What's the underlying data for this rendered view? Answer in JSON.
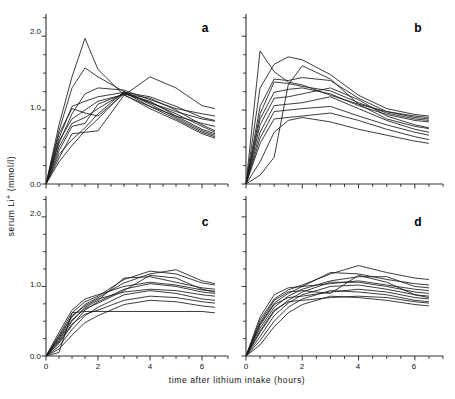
{
  "figure": {
    "xlabel": "time after lithium intake (hours)",
    "ylabel_parts": {
      "pre": "serum Li",
      "sup": "+",
      "post": " (mmol/l)"
    },
    "ylabel": "serum Li+ (mmol/l)",
    "panel_a_letter": "a",
    "panel_b_letter": "b",
    "panel_c_letter": "c",
    "panel_d_letter": "d",
    "ytick_0": "0.0",
    "ytick_1": "1.0",
    "ytick_2": "2.0",
    "xtick_0": "0",
    "xtick_2": "2",
    "xtick_4": "4",
    "xtick_6": "6",
    "line_color": "#1a1a1a",
    "axis_color": "#333333"
  },
  "chart_data": [
    {
      "type": "line",
      "panel": "a",
      "title": "a",
      "xlabel": "time after lithium intake (hours)",
      "ylabel": "serum Li+ (mmol/l)",
      "xlim": [
        0,
        7
      ],
      "ylim": [
        0.0,
        2.3
      ],
      "xticks": [
        0,
        1,
        2,
        3,
        4,
        5,
        6,
        7
      ],
      "xticklabels": [
        "0",
        "",
        "2",
        "",
        "4",
        "",
        "6",
        ""
      ],
      "yticks": [
        0.0,
        0.5,
        1.0,
        1.5,
        2.0
      ],
      "yticklabels": [
        "0.0",
        "",
        "1.0",
        "",
        "2.0"
      ],
      "grid": false,
      "legend": "none",
      "x": [
        0,
        0.5,
        1,
        1.5,
        2,
        3,
        4,
        5,
        6,
        6.5
      ],
      "series": [
        {
          "name": "subject 1",
          "values": [
            0.0,
            0.8,
            1.45,
            1.97,
            1.55,
            1.2,
            1.05,
            0.92,
            0.82,
            0.78
          ]
        },
        {
          "name": "subject 2",
          "values": [
            0.0,
            0.72,
            1.3,
            1.57,
            1.45,
            1.25,
            1.1,
            0.98,
            0.88,
            0.85
          ]
        },
        {
          "name": "subject 3",
          "values": [
            0.0,
            0.55,
            0.95,
            1.22,
            1.3,
            1.27,
            1.14,
            1.02,
            0.95,
            0.92
          ]
        },
        {
          "name": "subject 4",
          "values": [
            0.0,
            0.62,
            1.05,
            1.12,
            1.18,
            1.24,
            1.18,
            1.05,
            0.9,
            0.86
          ]
        },
        {
          "name": "subject 5",
          "values": [
            0.0,
            0.45,
            0.78,
            0.82,
            1.08,
            1.22,
            1.16,
            1.0,
            0.8,
            0.72
          ]
        },
        {
          "name": "subject 6",
          "values": [
            0.0,
            0.5,
            0.82,
            0.9,
            1.02,
            1.23,
            1.1,
            0.95,
            0.78,
            0.7
          ]
        },
        {
          "name": "subject 7",
          "values": [
            0.0,
            0.35,
            0.68,
            0.7,
            0.72,
            1.2,
            1.45,
            1.3,
            1.06,
            1.02
          ]
        },
        {
          "name": "subject 8",
          "values": [
            0.0,
            0.68,
            1.02,
            0.96,
            0.92,
            1.22,
            1.12,
            0.92,
            0.74,
            0.68
          ]
        },
        {
          "name": "subject 9",
          "values": [
            0.0,
            0.3,
            0.52,
            0.72,
            0.88,
            1.24,
            1.05,
            0.88,
            0.7,
            0.64
          ]
        },
        {
          "name": "subject 10",
          "values": [
            0.0,
            0.4,
            0.6,
            0.76,
            0.95,
            1.25,
            1.08,
            0.9,
            0.72,
            0.66
          ]
        },
        {
          "name": "subject 11",
          "values": [
            0.0,
            0.58,
            0.88,
            1.0,
            1.12,
            1.21,
            1.02,
            0.86,
            0.68,
            0.62
          ]
        }
      ]
    },
    {
      "type": "line",
      "panel": "b",
      "title": "b",
      "xlabel": "time after lithium intake (hours)",
      "ylabel": "serum Li+ (mmol/l)",
      "xlim": [
        0,
        7
      ],
      "ylim": [
        0.0,
        2.3
      ],
      "xticks": [
        0,
        1,
        2,
        3,
        4,
        5,
        6,
        7
      ],
      "xticklabels": [
        "0",
        "",
        "2",
        "",
        "4",
        "",
        "6",
        ""
      ],
      "yticks": [
        0.0,
        0.5,
        1.0,
        1.5,
        2.0
      ],
      "yticklabels": [
        "0.0",
        "",
        "1.0",
        "",
        "2.0"
      ],
      "grid": false,
      "legend": "none",
      "x": [
        0,
        0.5,
        1,
        1.5,
        2,
        3,
        4,
        5,
        6,
        6.5
      ],
      "series": [
        {
          "name": "subject 1",
          "values": [
            0.0,
            1.8,
            1.52,
            1.38,
            1.34,
            1.2,
            1.08,
            0.98,
            0.92,
            0.9
          ]
        },
        {
          "name": "subject 2",
          "values": [
            0.0,
            1.3,
            1.62,
            1.72,
            1.68,
            1.48,
            1.2,
            1.02,
            0.94,
            0.92
          ]
        },
        {
          "name": "subject 3",
          "values": [
            0.0,
            1.05,
            1.42,
            1.4,
            1.44,
            1.4,
            1.16,
            0.98,
            0.9,
            0.88
          ]
        },
        {
          "name": "subject 4",
          "values": [
            0.0,
            0.95,
            1.38,
            1.36,
            1.32,
            1.26,
            1.1,
            0.96,
            0.88,
            0.86
          ]
        },
        {
          "name": "subject 5",
          "values": [
            0.0,
            0.88,
            1.24,
            1.28,
            1.3,
            1.22,
            1.06,
            0.94,
            0.86,
            0.84
          ]
        },
        {
          "name": "subject 6",
          "values": [
            0.0,
            0.8,
            1.16,
            1.18,
            1.22,
            1.3,
            1.14,
            0.92,
            0.8,
            0.76
          ]
        },
        {
          "name": "subject 7",
          "values": [
            0.0,
            0.7,
            1.06,
            1.08,
            1.1,
            1.18,
            1.02,
            0.86,
            0.74,
            0.7
          ]
        },
        {
          "name": "subject 8",
          "values": [
            0.0,
            0.62,
            0.98,
            1.0,
            1.02,
            1.05,
            0.92,
            0.8,
            0.7,
            0.66
          ]
        },
        {
          "name": "subject 9",
          "values": [
            0.0,
            0.55,
            0.88,
            0.9,
            0.92,
            0.96,
            0.86,
            0.74,
            0.64,
            0.6
          ]
        },
        {
          "name": "subject 10",
          "values": [
            0.0,
            0.3,
            0.7,
            0.86,
            0.9,
            0.84,
            0.74,
            0.66,
            0.58,
            0.55
          ]
        },
        {
          "name": "subject 11",
          "values": [
            0.0,
            0.12,
            0.36,
            1.34,
            1.6,
            1.42,
            1.08,
            0.88,
            0.78,
            0.75
          ]
        }
      ]
    },
    {
      "type": "line",
      "panel": "c",
      "title": "c",
      "xlabel": "time after lithium intake (hours)",
      "ylabel": "serum Li+ (mmol/l)",
      "xlim": [
        0,
        7
      ],
      "ylim": [
        0.0,
        2.3
      ],
      "xticks": [
        0,
        1,
        2,
        3,
        4,
        5,
        6,
        7
      ],
      "xticklabels": [
        "0",
        "",
        "2",
        "",
        "4",
        "",
        "6",
        ""
      ],
      "yticks": [
        0.0,
        0.5,
        1.0,
        1.5,
        2.0
      ],
      "yticklabels": [
        "0.0",
        "",
        "1.0",
        "",
        "2.0"
      ],
      "grid": false,
      "legend": "none",
      "x": [
        0,
        0.5,
        1,
        1.5,
        2,
        3,
        4,
        5,
        6,
        6.5
      ],
      "series": [
        {
          "name": "subject 1",
          "values": [
            0.0,
            0.3,
            0.62,
            0.78,
            0.86,
            1.1,
            1.22,
            1.18,
            1.05,
            1.02
          ]
        },
        {
          "name": "subject 2",
          "values": [
            0.0,
            0.26,
            0.56,
            0.74,
            0.84,
            1.05,
            1.18,
            1.24,
            1.08,
            1.04
          ]
        },
        {
          "name": "subject 3",
          "values": [
            0.0,
            0.22,
            0.5,
            0.7,
            0.8,
            1.12,
            1.14,
            1.06,
            0.98,
            0.96
          ]
        },
        {
          "name": "subject 4",
          "values": [
            0.0,
            0.34,
            0.66,
            0.82,
            0.88,
            1.0,
            1.06,
            1.02,
            0.95,
            0.93
          ]
        },
        {
          "name": "subject 5",
          "values": [
            0.0,
            0.18,
            0.44,
            0.66,
            0.78,
            0.96,
            1.04,
            1.0,
            0.92,
            0.9
          ]
        },
        {
          "name": "subject 6",
          "values": [
            0.0,
            0.28,
            0.58,
            0.72,
            0.82,
            0.92,
            0.96,
            0.94,
            0.88,
            0.86
          ]
        },
        {
          "name": "subject 7",
          "values": [
            0.0,
            0.14,
            0.38,
            0.58,
            0.7,
            0.88,
            0.94,
            0.9,
            0.82,
            0.8
          ]
        },
        {
          "name": "subject 8",
          "values": [
            0.0,
            0.2,
            0.46,
            0.6,
            0.66,
            0.8,
            0.86,
            0.84,
            0.78,
            0.76
          ]
        },
        {
          "name": "subject 9",
          "values": [
            0.0,
            0.1,
            0.3,
            0.48,
            0.58,
            0.74,
            0.8,
            0.78,
            0.72,
            0.7
          ]
        },
        {
          "name": "subject 10",
          "values": [
            0.0,
            0.05,
            0.62,
            0.64,
            0.64,
            0.64,
            0.64,
            0.64,
            0.64,
            0.62
          ]
        },
        {
          "name": "subject 11",
          "values": [
            0.0,
            0.24,
            0.52,
            0.68,
            0.76,
            0.94,
            1.16,
            1.12,
            0.96,
            0.92
          ]
        }
      ]
    },
    {
      "type": "line",
      "panel": "d",
      "title": "d",
      "xlabel": "time after lithium intake (hours)",
      "ylabel": "serum Li+ (mmol/l)",
      "xlim": [
        0,
        7
      ],
      "ylim": [
        0.0,
        2.3
      ],
      "xticks": [
        0,
        1,
        2,
        3,
        4,
        5,
        6,
        7
      ],
      "xticklabels": [
        "0",
        "",
        "2",
        "",
        "4",
        "",
        "6",
        ""
      ],
      "yticks": [
        0.0,
        0.5,
        1.0,
        1.5,
        2.0
      ],
      "yticklabels": [
        "0.0",
        "",
        "1.0",
        "",
        "2.0"
      ],
      "grid": false,
      "legend": "none",
      "x": [
        0,
        0.5,
        1,
        1.5,
        2,
        3,
        4,
        5,
        6,
        6.5
      ],
      "series": [
        {
          "name": "subject 1",
          "values": [
            0.0,
            0.52,
            0.82,
            0.95,
            1.02,
            1.18,
            1.3,
            1.2,
            1.12,
            1.1
          ]
        },
        {
          "name": "subject 2",
          "values": [
            0.0,
            0.46,
            0.76,
            0.9,
            1.0,
            1.2,
            1.18,
            1.1,
            1.04,
            1.02
          ]
        },
        {
          "name": "subject 3",
          "values": [
            0.0,
            0.4,
            0.7,
            0.86,
            0.96,
            1.08,
            1.14,
            1.14,
            1.0,
            0.98
          ]
        },
        {
          "name": "subject 4",
          "values": [
            0.0,
            0.56,
            0.88,
            0.98,
            1.0,
            1.04,
            1.08,
            1.02,
            0.96,
            0.94
          ]
        },
        {
          "name": "subject 5",
          "values": [
            0.0,
            0.34,
            0.64,
            0.8,
            0.92,
            1.06,
            1.06,
            1.0,
            0.92,
            0.9
          ]
        },
        {
          "name": "subject 6",
          "values": [
            0.0,
            0.28,
            0.58,
            0.76,
            0.88,
            1.0,
            1.02,
            0.96,
            0.88,
            0.86
          ]
        },
        {
          "name": "subject 7",
          "values": [
            0.0,
            0.44,
            0.74,
            0.84,
            0.86,
            0.92,
            0.96,
            0.92,
            0.84,
            0.82
          ]
        },
        {
          "name": "subject 8",
          "values": [
            0.0,
            0.22,
            0.5,
            0.7,
            0.82,
            0.94,
            0.92,
            0.88,
            0.8,
            0.78
          ]
        },
        {
          "name": "subject 9",
          "values": [
            0.0,
            0.36,
            0.66,
            0.78,
            0.8,
            0.84,
            0.86,
            0.84,
            0.78,
            0.76
          ]
        },
        {
          "name": "subject 10",
          "values": [
            0.0,
            0.16,
            0.42,
            0.62,
            0.74,
            0.86,
            0.84,
            0.8,
            0.74,
            0.72
          ]
        },
        {
          "name": "subject 11",
          "values": [
            0.0,
            0.48,
            0.8,
            0.92,
            0.94,
            0.9,
            1.16,
            1.06,
            0.88,
            0.84
          ]
        }
      ]
    }
  ]
}
